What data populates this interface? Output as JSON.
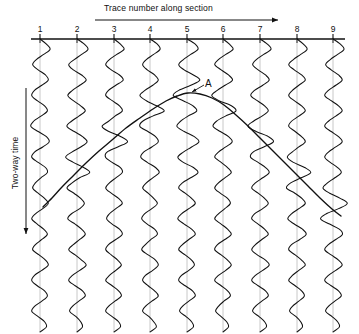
{
  "figure": {
    "kind": "seismic-section-wiggle-trace",
    "width": 359,
    "height": 334,
    "background": "#ffffff",
    "ink": "#111111"
  },
  "top_axis": {
    "label": "Trace number along section",
    "arrow_direction": "right",
    "arrow_x_start": 95,
    "arrow_x_end": 281,
    "arrow_y": 20,
    "baseline_y": 39,
    "baseline_x_start": 31,
    "baseline_x_end": 345
  },
  "left_axis": {
    "label": "Two-way time",
    "arrow_direction": "down",
    "arrow_x": 26,
    "arrow_y_start": 88,
    "arrow_y_end": 238
  },
  "annotations": [
    {
      "name": "diffraction-apex-label",
      "text": "A",
      "x": 205,
      "y": 78,
      "points_to_x": 188,
      "points_to_y": 93
    }
  ],
  "trace_numbers": [
    "1",
    "2",
    "3",
    "4",
    "5",
    "6",
    "7",
    "8",
    "9"
  ],
  "chart_data": {
    "type": "line",
    "title": "",
    "subtitle": "",
    "xlabel": "Trace number along section",
    "ylabel": "Two-way time",
    "grid": false,
    "legend": "none",
    "x": [
      1,
      2,
      3,
      4,
      5,
      6,
      7,
      8,
      9
    ],
    "trace_x_px": [
      40,
      77,
      114,
      150,
      187,
      223,
      260,
      297,
      333
    ],
    "trace_top_y_px": 39,
    "trace_bottom_y_px": 332,
    "trace_spacing_px": 36.6,
    "wiggle_amplitude_px": 11,
    "series": [
      {
        "name": "diffraction-hyperbola",
        "description": "Diffraction event curve, apex near trace 5, limbs descending to both sides",
        "points_px": [
          [
            43,
            207
          ],
          [
            52,
            198
          ],
          [
            62,
            187
          ],
          [
            74,
            175
          ],
          [
            86,
            163
          ],
          [
            99,
            151
          ],
          [
            112,
            140
          ],
          [
            126,
            128
          ],
          [
            140,
            118
          ],
          [
            153,
            109
          ],
          [
            166,
            101
          ],
          [
            177,
            96
          ],
          [
            188,
            93
          ],
          [
            200,
            94
          ],
          [
            212,
            98
          ],
          [
            224,
            105
          ],
          [
            236,
            115
          ],
          [
            248,
            126
          ],
          [
            260,
            138
          ],
          [
            272,
            150
          ],
          [
            284,
            162
          ],
          [
            296,
            174
          ],
          [
            308,
            186
          ],
          [
            320,
            198
          ],
          [
            332,
            209
          ],
          [
            341,
            216
          ]
        ],
        "apex_px": [
          188,
          93
        ]
      },
      {
        "name": "wiggle-traces",
        "description": "Nine vertical seismic wiggle traces oscillating about their zero lines"
      }
    ]
  },
  "wiggle_profiles": [
    [
      0,
      7,
      11,
      4,
      -4,
      -8,
      -2,
      6,
      9,
      2,
      -6,
      -9,
      -3,
      5,
      8,
      1,
      -7,
      -10,
      -2,
      7,
      10,
      3,
      -6,
      -9,
      -2,
      6,
      8,
      1,
      -5,
      -8,
      -2,
      5,
      9,
      3,
      -5,
      -9,
      -3,
      4,
      8,
      2,
      -5,
      -8,
      -1,
      6,
      9,
      2,
      -6,
      -9,
      -3,
      5,
      8,
      2,
      -6,
      -9,
      -2,
      5,
      7,
      0
    ],
    [
      0,
      8,
      12,
      5,
      -3,
      -9,
      -4,
      5,
      10,
      3,
      -5,
      -10,
      -4,
      4,
      9,
      2,
      -6,
      -11,
      -3,
      6,
      11,
      4,
      -5,
      -10,
      -3,
      5,
      9,
      2,
      -4,
      -9,
      -3,
      4,
      8,
      3,
      -6,
      -10,
      -2,
      5,
      9,
      3,
      -4,
      -9,
      -2,
      5,
      10,
      3,
      -5,
      -9,
      -2,
      6,
      9,
      2,
      -5,
      -8,
      -1,
      4,
      6,
      0
    ],
    [
      0,
      7,
      11,
      3,
      -5,
      -9,
      -3,
      6,
      10,
      2,
      -6,
      -9,
      -2,
      6,
      9,
      1,
      -5,
      -10,
      -4,
      5,
      10,
      3,
      -6,
      -8,
      -2,
      7,
      9,
      2,
      -5,
      -9,
      -3,
      5,
      9,
      2,
      -5,
      -8,
      -2,
      6,
      9,
      2,
      -6,
      -9,
      -3,
      4,
      8,
      2,
      -5,
      -9,
      -2,
      5,
      8,
      1,
      -6,
      -9,
      -2,
      5,
      7,
      0
    ],
    [
      0,
      8,
      11,
      4,
      -4,
      -8,
      -3,
      5,
      9,
      3,
      -5,
      -9,
      -3,
      5,
      10,
      2,
      -6,
      -9,
      -2,
      6,
      9,
      2,
      -7,
      -10,
      -3,
      6,
      10,
      3,
      -4,
      -8,
      -2,
      4,
      8,
      2,
      -6,
      -9,
      -3,
      5,
      8,
      1,
      -5,
      -9,
      -2,
      6,
      9,
      3,
      -5,
      -8,
      -2,
      5,
      9,
      2,
      -5,
      -8,
      -1,
      4,
      7,
      0
    ],
    [
      0,
      9,
      12,
      4,
      -4,
      -9,
      -3,
      6,
      11,
      3,
      -6,
      -10,
      -3,
      5,
      9,
      1,
      -7,
      -11,
      -3,
      8,
      13,
      5,
      -4,
      -10,
      -4,
      7,
      12,
      4,
      -5,
      -9,
      -2,
      5,
      9,
      2,
      -6,
      -10,
      -3,
      5,
      9,
      2,
      -5,
      -9,
      -2,
      5,
      8,
      2,
      -6,
      -9,
      -2,
      6,
      9,
      2,
      -5,
      -8,
      -1,
      5,
      7,
      0
    ],
    [
      0,
      7,
      11,
      3,
      -5,
      -9,
      -2,
      6,
      10,
      2,
      -5,
      -9,
      -3,
      6,
      10,
      2,
      -6,
      -10,
      -3,
      6,
      10,
      3,
      -5,
      -9,
      -2,
      5,
      9,
      2,
      -5,
      -9,
      -3,
      5,
      8,
      2,
      -5,
      -9,
      -2,
      5,
      9,
      2,
      -6,
      -9,
      -2,
      5,
      9,
      3,
      -5,
      -9,
      -2,
      5,
      8,
      1,
      -5,
      -8,
      -2,
      4,
      6,
      0
    ],
    [
      0,
      8,
      12,
      4,
      -4,
      -8,
      -2,
      6,
      10,
      3,
      -6,
      -10,
      -3,
      5,
      9,
      2,
      -6,
      -10,
      -3,
      6,
      10,
      3,
      -6,
      -9,
      -2,
      6,
      10,
      3,
      -5,
      -9,
      -2,
      5,
      9,
      3,
      -6,
      -9,
      -2,
      5,
      9,
      2,
      -5,
      -9,
      -3,
      6,
      10,
      3,
      -5,
      -9,
      -2,
      6,
      9,
      2,
      -5,
      -8,
      -1,
      5,
      7,
      0
    ],
    [
      0,
      7,
      11,
      4,
      -4,
      -9,
      -3,
      5,
      9,
      2,
      -5,
      -9,
      -3,
      5,
      9,
      2,
      -6,
      -9,
      -2,
      5,
      9,
      2,
      -5,
      -9,
      -3,
      6,
      10,
      3,
      -5,
      -9,
      -2,
      5,
      9,
      2,
      -6,
      -10,
      -3,
      6,
      10,
      3,
      -6,
      -9,
      -2,
      5,
      9,
      2,
      -5,
      -9,
      -2,
      5,
      8,
      2,
      -5,
      -8,
      -1,
      4,
      6,
      0
    ],
    [
      0,
      8,
      12,
      5,
      -3,
      -8,
      -2,
      6,
      10,
      3,
      -5,
      -9,
      -2,
      6,
      10,
      3,
      -5,
      -9,
      -2,
      6,
      10,
      3,
      -5,
      -9,
      -3,
      5,
      9,
      2,
      -6,
      -10,
      -3,
      6,
      11,
      4,
      -5,
      -10,
      -3,
      6,
      10,
      3,
      -5,
      -9,
      -2,
      6,
      10,
      3,
      -5,
      -9,
      -2,
      6,
      9,
      2,
      -5,
      -8,
      -1,
      5,
      7,
      0
    ]
  ]
}
